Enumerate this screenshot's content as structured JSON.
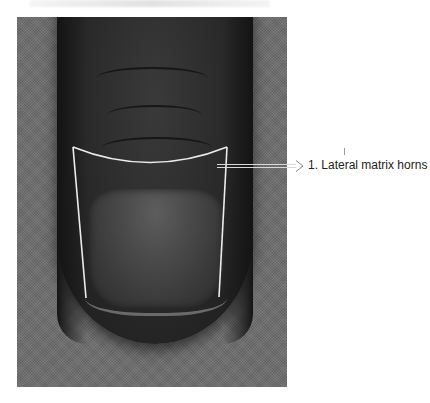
{
  "figure": {
    "type": "clinical-photograph",
    "background": "grey textured fabric",
    "annotation": {
      "number": "1",
      "label": "1. Lateral matrix horns",
      "arrow_style": "hollow double-line arrow pointing right",
      "outline_color": "#e8e8e8"
    }
  }
}
